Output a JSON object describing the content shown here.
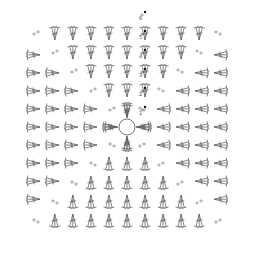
{
  "diagram": {
    "type": "crochet-chart",
    "title": "",
    "pattern": "granny square",
    "rounds": 6,
    "round_labels": [
      "1",
      "2",
      "3",
      "4",
      "5",
      "6"
    ],
    "symbols": {
      "center": "magic ring",
      "cluster": "3 double crochet (dc) group",
      "chain": "chain stitch (oval)",
      "start_marker": "slip stitch / join (filled dot)"
    },
    "colors": {
      "stroke": "#555555",
      "background": "#ffffff",
      "marker": "#111111"
    },
    "grid_size": 6,
    "ring_center": [
      127,
      127
    ]
  }
}
